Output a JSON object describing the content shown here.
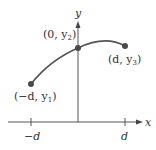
{
  "diagram": {
    "axes": {
      "x_label": "x",
      "y_label": "y",
      "x_ticks": [
        "−d",
        "d"
      ]
    },
    "points": [
      {
        "label": "(−d, y",
        "sub": "1",
        "close": ")",
        "name": "left"
      },
      {
        "label": "(0, y",
        "sub": "2",
        "close": ")",
        "name": "middle"
      },
      {
        "label": "(d, y",
        "sub": "3",
        "close": ")",
        "name": "right"
      }
    ],
    "colors": {
      "axis": "#444444",
      "curve": "#555555",
      "point": "#4a4a4a"
    }
  }
}
